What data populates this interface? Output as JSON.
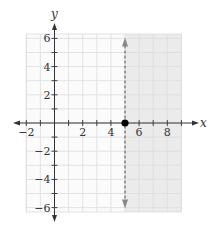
{
  "chart_data": {
    "type": "line",
    "title": "",
    "xlabel": "x",
    "ylabel": "y",
    "xlim": [
      -2,
      9
    ],
    "ylim": [
      -6,
      6
    ],
    "grid": true,
    "x_ticks": [
      -2,
      -1,
      0,
      1,
      2,
      3,
      4,
      5,
      6,
      7,
      8,
      9
    ],
    "x_tick_labels": [
      "-2",
      "2",
      "4",
      "6",
      "8"
    ],
    "x_tick_label_values": [
      -2,
      2,
      4,
      6,
      8
    ],
    "y_ticks": [
      -6,
      -5,
      -4,
      -3,
      -2,
      -1,
      0,
      1,
      2,
      3,
      4,
      5,
      6
    ],
    "y_tick_labels": [
      "6",
      "4",
      "2",
      "-2",
      "-4",
      "-6"
    ],
    "y_tick_label_values": [
      6,
      4,
      2,
      -2,
      -4,
      -6
    ],
    "series": [
      {
        "name": "boundary x = 5",
        "style": "dashed",
        "orientation": "vertical",
        "x": [
          5,
          5
        ],
        "y": [
          -6,
          6
        ],
        "arrows": "both",
        "color": "#888888"
      }
    ],
    "points": [
      {
        "x": 5,
        "y": 0,
        "style": "filled",
        "color": "#000000"
      }
    ],
    "shaded_region": {
      "x_from": 5,
      "x_to": 9,
      "color": "#ebebeb"
    }
  },
  "colors": {
    "axis": "#333333",
    "grid": "#dcdcdc",
    "shade": "#ebebeb",
    "dashed_line": "#888888",
    "point": "#000000"
  },
  "labels": {
    "x_axis": "x",
    "y_axis": "y"
  }
}
